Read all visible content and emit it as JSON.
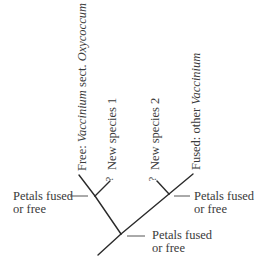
{
  "diagram": {
    "type": "phylogenetic-tree",
    "line_color": "#2a2a2a",
    "text_color": "#3a3a3a",
    "taxa": [
      {
        "id": "oxycoccum",
        "prefix": "Free: ",
        "italic": "Vaccinium",
        "mid": " sect. ",
        "italic2": "Oxycoccum"
      },
      {
        "id": "new1",
        "qmark": "?",
        "label": "New species 1"
      },
      {
        "id": "new2",
        "qmark": "?",
        "label": "New species 2"
      },
      {
        "id": "other",
        "prefix": "Fused: other ",
        "italic": "Vaccinium"
      }
    ],
    "nodes": [
      {
        "id": "left-node",
        "label_line1": "Petals fused",
        "label_line2": "or free"
      },
      {
        "id": "right-node",
        "label_line1": "Petals fused",
        "label_line2": "or free"
      },
      {
        "id": "root-node",
        "label_line1": "Petals fused",
        "label_line2": "or free"
      }
    ]
  }
}
